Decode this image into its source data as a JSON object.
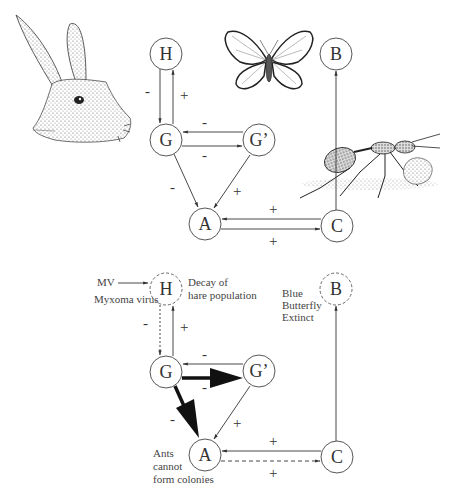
{
  "top_diagram": {
    "nodes": {
      "H": "H",
      "B": "B",
      "G": "G",
      "Gp": "G’",
      "A": "A",
      "C": "C"
    },
    "edge_signs": {
      "G_to_H": "+",
      "H_to_G": "-",
      "Gp_to_G": "-",
      "G_to_Gp": "-",
      "G_to_A": "-",
      "Gp_to_A": "+",
      "C_to_A": "+",
      "A_to_C": "+"
    },
    "illustrations": {
      "hare": "hare-head",
      "butterfly": "blue-butterfly",
      "ant": "ant-with-larva"
    }
  },
  "bottom_diagram": {
    "nodes": {
      "H": "H",
      "B": "B",
      "G": "G",
      "Gp": "G’",
      "A": "A",
      "C": "C"
    },
    "edge_signs": {
      "G_to_H": "+",
      "H_to_G": "-",
      "Gp_to_G": "-",
      "G_to_Gp": "-",
      "G_to_A": "-",
      "Gp_to_A": "+",
      "C_to_A": "+",
      "A_to_C": "+"
    },
    "annotations": {
      "mv": "MV",
      "myxoma": "Myxoma virus",
      "decay_line1": "Decay of",
      "decay_line2": "hare population",
      "butterfly_line1": "Blue",
      "butterfly_line2": "Butterfly",
      "butterfly_line3": "Extinct",
      "ants_line1": "Ants",
      "ants_line2": "cannot",
      "ants_line3": "form colonies"
    }
  }
}
